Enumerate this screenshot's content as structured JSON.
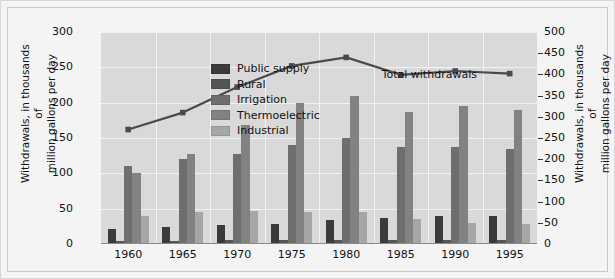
{
  "chart_data": {
    "type": "bar",
    "title": "",
    "subtitle": "",
    "xlabel": "",
    "ylabel": "Withdrawals, in thousands of\nmillion gallons per day",
    "ylabel_right": "Withdrawals, in thousands of\nmillion gallons per day",
    "categories": [
      "1960",
      "1965",
      "1970",
      "1975",
      "1980",
      "1985",
      "1990",
      "1995"
    ],
    "ylim": [
      0,
      300
    ],
    "yticks": [
      0,
      50,
      100,
      150,
      200,
      250,
      300
    ],
    "ylim_right": [
      0,
      500
    ],
    "yticks_right": [
      0,
      50,
      100,
      150,
      200,
      250,
      300,
      350,
      400,
      450,
      500
    ],
    "grid": true,
    "legend_position": "upper-left-inside",
    "series": [
      {
        "name": "Public supply",
        "color": "#3b3b3b",
        "axis": "left",
        "values": [
          21,
          24,
          27,
          29,
          34,
          37,
          39,
          40
        ]
      },
      {
        "name": "Rural",
        "color": "#555555",
        "axis": "left",
        "values": [
          4,
          4,
          5,
          5,
          6,
          6,
          5,
          5
        ]
      },
      {
        "name": "Irrigation",
        "color": "#6e6e6e",
        "axis": "left",
        "values": [
          110,
          120,
          128,
          140,
          150,
          137,
          137,
          134
        ]
      },
      {
        "name": "Thermoelectric",
        "color": "#828282",
        "axis": "left",
        "values": [
          100,
          128,
          168,
          200,
          210,
          187,
          195,
          190
        ]
      },
      {
        "name": "Industrial",
        "color": "#a6a6a6",
        "axis": "left",
        "values": [
          39,
          46,
          47,
          45,
          45,
          36,
          30,
          29
        ]
      }
    ],
    "line_series": {
      "name": "Total withdrawals",
      "color": "#4a4a4a",
      "axis": "right",
      "marker": "square",
      "values": [
        270,
        310,
        370,
        420,
        440,
        399,
        408,
        402
      ]
    },
    "annotations": [
      {
        "name": "total-withdrawals-label",
        "text": "Total withdrawals",
        "x": 0.74,
        "y": 0.2
      }
    ]
  },
  "style": {
    "plot_bg": "#d9d9d9",
    "figure_bg": "#f4f4f4",
    "grid_color": "#f2f2f2",
    "axis_text": "#111111"
  }
}
